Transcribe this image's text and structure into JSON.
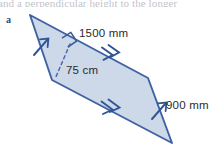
{
  "page": {
    "background_color": "#ffffff",
    "width": 221,
    "height": 148,
    "clipped_header_text": "and  a  perpendicular  height  to  the  longer"
  },
  "figure": {
    "part_label": "a",
    "part_label_color": "#2a4a86",
    "shape": "parallelogram",
    "fill_color": "#ccd7e9",
    "stroke_color": "#3a5d9f",
    "dashed_stroke_color": "#4b6ca8",
    "vertices": [
      {
        "name": "top-left",
        "x": 30,
        "y": 15
      },
      {
        "name": "right-top",
        "x": 148,
        "y": 78
      },
      {
        "name": "bottom-right",
        "x": 172,
        "y": 143
      },
      {
        "name": "left-bottom",
        "x": 52,
        "y": 80
      }
    ],
    "right_angle_marker": {
      "x": 70,
      "y": 44,
      "present": true
    },
    "height_line": {
      "style": "dashed",
      "from": {
        "x": 70,
        "y": 44
      },
      "to": {
        "x": 55,
        "y": 79
      }
    },
    "tick_marks": [
      {
        "edge": "left",
        "count": 1,
        "x": 41,
        "y": 47
      },
      {
        "edge": "right",
        "count": 1,
        "x": 160,
        "y": 110
      }
    ],
    "arrow_marks": [
      {
        "edge": "top-right",
        "count": 2,
        "x": 112,
        "y": 56
      },
      {
        "edge": "bottom",
        "count": 2,
        "x": 112,
        "y": 110
      }
    ]
  },
  "dimensions": {
    "top_side": {
      "value": "1500 mm",
      "measure": 1500,
      "unit": "mm",
      "edge": "top-long-side"
    },
    "height": {
      "value": "75 cm",
      "measure": 75,
      "unit": "cm",
      "edge": "perpendicular-height"
    },
    "side": {
      "value": "900 mm",
      "measure": 900,
      "unit": "mm",
      "edge": "short-side"
    }
  }
}
